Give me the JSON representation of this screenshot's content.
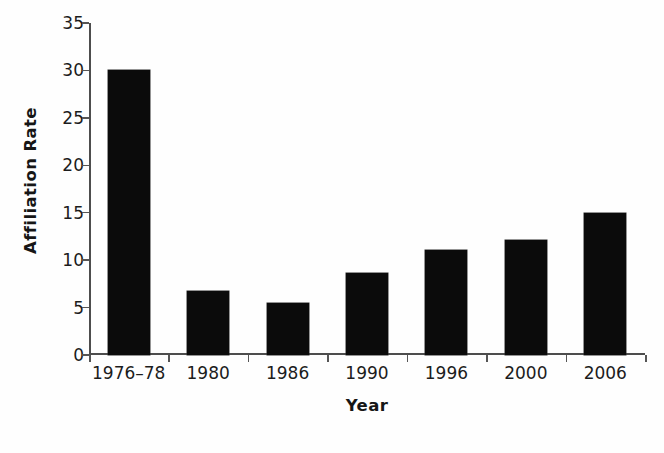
{
  "chart_data": {
    "type": "bar",
    "title": "",
    "subtitle": "",
    "xlabel": "Year",
    "ylabel": "Affiliation Rate",
    "categories": [
      "1976–78",
      "1980",
      "1986",
      "1990",
      "1996",
      "2000",
      "2006"
    ],
    "values": [
      30.0,
      6.8,
      5.5,
      8.6,
      11.1,
      12.1,
      15.0
    ],
    "series": [
      {
        "name": "Affiliation Rate",
        "values": [
          30.0,
          6.8,
          5.5,
          8.6,
          11.1,
          12.1,
          15.0
        ]
      }
    ],
    "ylim": [
      0,
      35
    ],
    "ytick_labels": [
      "0",
      "5",
      "10",
      "15",
      "20",
      "25",
      "30",
      "35"
    ],
    "ytick_values": [
      0,
      5,
      10,
      15,
      20,
      25,
      30,
      35
    ],
    "ytick_step": 5,
    "grid": false,
    "legend": false,
    "legend_position": "none",
    "bar_color": "#0b0b0b",
    "background_color": "#fefefe",
    "axis_color": "#4d4d4d",
    "annotations": []
  }
}
